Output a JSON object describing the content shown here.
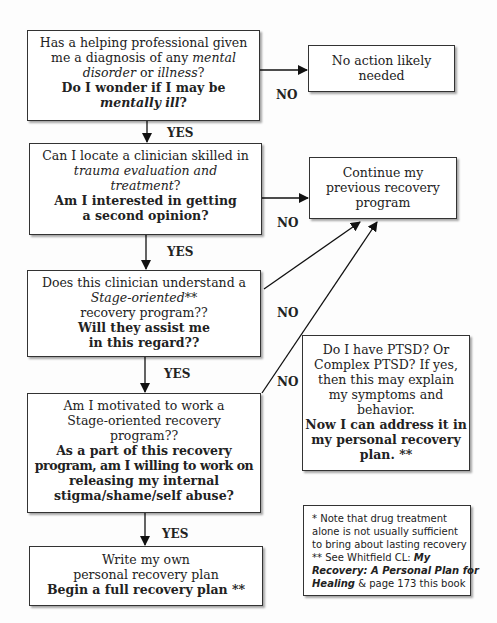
{
  "flowchart": {
    "q1": {
      "line1": "Has a helping professional given",
      "line2_pre": "me a diagnosis of any ",
      "line2_it": "mental",
      "line3_it1": "disorder",
      "line3_mid": " or ",
      "line3_it2": "illness",
      "line3_post": "?",
      "bold1": "Do I wonder if I may be",
      "bold2_it": "mentally ill",
      "bold2_post": "?"
    },
    "no_action": {
      "line1": "No action likely",
      "line2": "needed"
    },
    "q2": {
      "line1": "Can I locate a clinician skilled in",
      "line2_it": "trauma evaluation and",
      "line3_it": "treatment",
      "line3_post": "?",
      "bold1": "Am I interested in getting",
      "bold2": "a second opinion?"
    },
    "continue": {
      "line1": "Continue my",
      "line2": "previous recovery",
      "line3": "program"
    },
    "q3": {
      "line1": "Does this clinician understand a",
      "line2_it": "Stage-oriented**",
      "line3": "recovery program??",
      "bold1": "Will they assist me",
      "bold2": "in this regard??"
    },
    "q4": {
      "line1": "Am I motivated to work a",
      "line2": "Stage-oriented recovery",
      "line3": "program??",
      "bold1": "As a part of this recovery",
      "bold2": "program, am I willing to work on",
      "bold3": "releasing my internal",
      "bold4": "stigma/shame/self abuse?"
    },
    "ptsd": {
      "line1": "Do I have PTSD? Or",
      "line2": "Complex PTSD? If yes,",
      "line3": "then this may explain",
      "line4": "my symptoms and",
      "line5": "behavior.",
      "bold1": "Now I can address it in",
      "bold2": "my personal recovery",
      "bold3": "plan. **"
    },
    "plan": {
      "line1": "Write my own",
      "line2": "personal recovery plan",
      "bold1": "Begin a full recovery plan **"
    },
    "footnote": {
      "line1": "* Note that drug treatment",
      "line2": "alone is not usually sufficient",
      "line3": "to bring about lasting recovery",
      "line4_pre": "** See   Whitfield CL: ",
      "line4_bi": "My",
      "line5_bi": "Recovery: A Personal Plan for",
      "line6_bi": "Healing",
      "line6_post": " & page 173 this book"
    },
    "labels": {
      "yes": "YES",
      "no": "NO"
    }
  }
}
